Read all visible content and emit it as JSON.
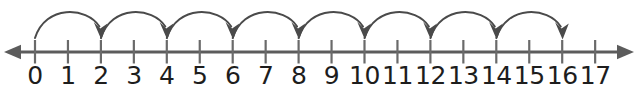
{
  "figure": {
    "width": 641,
    "height": 94,
    "background_color": "#ffffff"
  },
  "chart_data": {
    "type": "line",
    "xlabel": "",
    "ylabel": "",
    "orientation": "horizontal",
    "axis": {
      "min": 0,
      "max": 17,
      "step": 1,
      "left_arrow": true,
      "right_arrow": true,
      "line_color": "#5c5c5c",
      "tick_color": "#6a6a6a"
    },
    "tick_labels": [
      "0",
      "1",
      "2",
      "3",
      "4",
      "5",
      "6",
      "7",
      "8",
      "9",
      "10",
      "11",
      "12",
      "13",
      "14",
      "15",
      "16",
      "17"
    ],
    "tick_values": [
      0,
      1,
      2,
      3,
      4,
      5,
      6,
      7,
      8,
      9,
      10,
      11,
      12,
      13,
      14,
      15,
      16,
      17
    ],
    "jumps": [
      {
        "from": 0,
        "to": 2,
        "size": 2,
        "direction": "right"
      },
      {
        "from": 2,
        "to": 4,
        "size": 2,
        "direction": "right"
      },
      {
        "from": 4,
        "to": 6,
        "size": 2,
        "direction": "right"
      },
      {
        "from": 6,
        "to": 8,
        "size": 2,
        "direction": "right"
      },
      {
        "from": 8,
        "to": 10,
        "size": 2,
        "direction": "right"
      },
      {
        "from": 10,
        "to": 12,
        "size": 2,
        "direction": "right"
      },
      {
        "from": 12,
        "to": 14,
        "size": 2,
        "direction": "right"
      },
      {
        "from": 14,
        "to": 16,
        "size": 2,
        "direction": "right"
      }
    ],
    "jump_count": 8,
    "jump_color": "#4a4a4a",
    "grid": false,
    "legend": null,
    "annotations": []
  },
  "colors": {
    "axis": "#5c5c5c",
    "ticks": "#6a6a6a",
    "arcs": "#4a4a4a",
    "labels": "#1d1d1d",
    "background": "#ffffff"
  }
}
